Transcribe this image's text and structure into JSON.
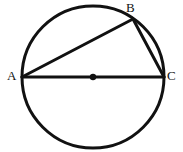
{
  "figure": {
    "kind": "circle-inscribed-triangle-diagram",
    "canvas": {
      "width": 183,
      "height": 152,
      "background": "#ffffff"
    },
    "stroke_color": "#111111",
    "fill_color": "none",
    "circle": {
      "cx": 93,
      "cy": 77,
      "r": 71,
      "stroke_width": 3
    },
    "center_point": {
      "cx": 93,
      "cy": 77,
      "r": 3.2,
      "name": "center-dot"
    },
    "points": [
      {
        "id": "A",
        "label": "A",
        "x": 22,
        "y": 77
      },
      {
        "id": "B",
        "label": "B",
        "x": 133,
        "y": 19
      },
      {
        "id": "C",
        "label": "C",
        "x": 164,
        "y": 77
      }
    ],
    "segments": [
      {
        "id": "AC",
        "from": "A",
        "to": "C",
        "x1": 22,
        "y1": 77,
        "x2": 164,
        "y2": 77,
        "stroke_width": 3,
        "name": "segment-ac-diameter"
      },
      {
        "id": "AB",
        "from": "A",
        "to": "B",
        "x1": 22,
        "y1": 77,
        "x2": 133,
        "y2": 19,
        "stroke_width": 3,
        "name": "segment-ab"
      },
      {
        "id": "BC",
        "from": "B",
        "to": "C",
        "x1": 133,
        "y1": 19,
        "x2": 164,
        "y2": 77,
        "stroke_width": 3,
        "name": "segment-bc"
      }
    ],
    "labels": {
      "A": "A",
      "B": "B",
      "C": "C"
    }
  }
}
